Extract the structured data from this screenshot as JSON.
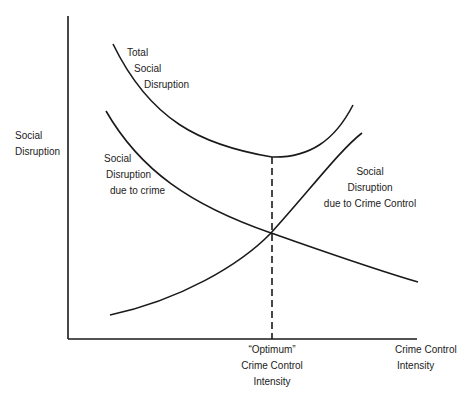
{
  "diagram": {
    "y_axis_label": [
      "Social",
      "Disruption"
    ],
    "x_axis_label": [
      "Crime Control",
      "Intensity"
    ],
    "optimum_label": [
      "“Optimum”",
      "Crime Control",
      "Intensity"
    ],
    "curves": {
      "total": [
        "Total",
        "Social",
        "Disruption"
      ],
      "due_to_crime": [
        "Social",
        "Disruption",
        "due to crime"
      ],
      "due_to_control": [
        "Social",
        "Disruption",
        "due to Crime Control"
      ]
    },
    "colors": {
      "line": "#1a1a1a",
      "background": "#ffffff"
    }
  }
}
